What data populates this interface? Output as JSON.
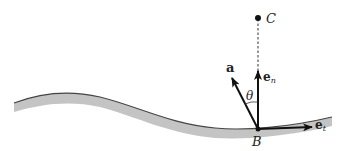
{
  "diagram": {
    "type": "vector-diagram",
    "colors": {
      "band_fill": "#c4c4c4",
      "band_edge": "#444444",
      "ink": "#111111"
    },
    "labels": {
      "center_point": "C",
      "point_on_path": "B",
      "acceleration_vector": "a",
      "normal_vector_base": "e",
      "normal_vector_sub": "n",
      "tangent_vector_base": "e",
      "tangent_vector_sub": "t",
      "angle": "θ"
    }
  }
}
